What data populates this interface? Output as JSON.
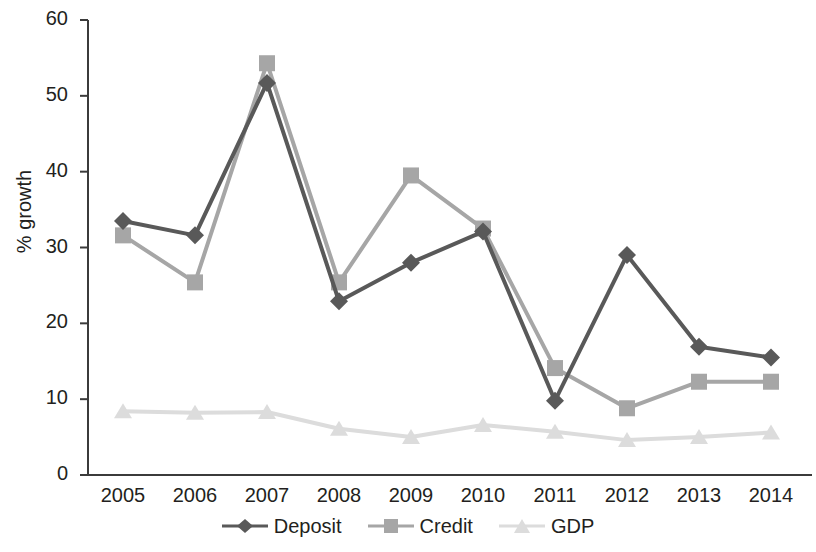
{
  "chart_data": {
    "type": "line",
    "title": "",
    "xlabel": "",
    "ylabel": "% growth",
    "categories": [
      "2005",
      "2006",
      "2007",
      "2008",
      "2009",
      "2010",
      "2011",
      "2012",
      "2013",
      "2014"
    ],
    "ylim": [
      0,
      60
    ],
    "yticks": [
      0,
      10,
      20,
      30,
      40,
      50,
      60
    ],
    "grid": false,
    "legend_position": "bottom",
    "series": [
      {
        "name": "Deposit",
        "marker": "diamond",
        "color": "#595959",
        "values": [
          33.5,
          31.6,
          51.7,
          22.9,
          28.0,
          32.1,
          9.8,
          29.0,
          16.9,
          15.5
        ]
      },
      {
        "name": "Credit",
        "marker": "square",
        "color": "#a6a6a6",
        "values": [
          31.6,
          25.4,
          54.3,
          25.4,
          39.5,
          32.5,
          14.1,
          8.8,
          12.3,
          12.3
        ]
      },
      {
        "name": "GDP",
        "marker": "triangle",
        "color": "#dcdcdc",
        "values": [
          8.4,
          8.2,
          8.3,
          6.1,
          5.0,
          6.6,
          5.7,
          4.6,
          5.0,
          5.6
        ]
      }
    ]
  },
  "axis": {
    "y_label": "% growth",
    "y_ticks": [
      "60",
      "50",
      "40",
      "30",
      "20",
      "10",
      "0"
    ],
    "x_ticks": [
      "2005",
      "2006",
      "2007",
      "2008",
      "2009",
      "2010",
      "2011",
      "2012",
      "2013",
      "2014"
    ]
  },
  "legend": {
    "items": [
      {
        "label": "Deposit",
        "color": "#595959",
        "marker": "diamond-marker-icon"
      },
      {
        "label": "Credit",
        "color": "#a6a6a6",
        "marker": "square-marker-icon"
      },
      {
        "label": "GDP",
        "color": "#dcdcdc",
        "marker": "triangle-marker-icon"
      }
    ]
  }
}
